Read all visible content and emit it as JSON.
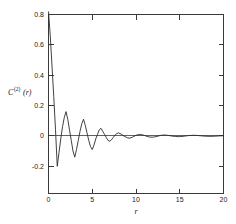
{
  "figure": {
    "background_color": "#ffffff",
    "line_color": "#2b2b2b",
    "axis_color": "#3a3a3a"
  },
  "axes": {
    "y_label_base": "C",
    "y_label_superscript": "(2)",
    "y_label_argument": "(r)",
    "x_label": "r",
    "y_ticks": [
      "0.8",
      "0.6",
      "0.4",
      "0.2",
      "0",
      "-0.2"
    ],
    "y_tick_values": [
      0.8,
      0.6,
      0.4,
      0.2,
      0,
      -0.2
    ],
    "x_ticks": [
      "0",
      "5",
      "10",
      "15",
      "20"
    ],
    "x_tick_values": [
      0,
      5,
      10,
      15,
      20
    ]
  },
  "chart_data": {
    "type": "line",
    "title": "",
    "xlabel": "r",
    "ylabel": "C^(2)(r)",
    "xlim": [
      0,
      20
    ],
    "ylim": [
      -0.28,
      0.8
    ],
    "grid": false,
    "legend": null,
    "series": [
      {
        "name": "C^(2)(r)",
        "color": "#2b2b2b",
        "x": [
          0.0,
          0.2,
          0.4,
          0.6,
          0.8,
          1.0,
          1.2,
          1.4,
          1.6,
          1.8,
          2.0,
          2.2,
          2.4,
          2.6,
          2.8,
          3.0,
          3.2,
          3.4,
          3.6,
          3.8,
          4.0,
          4.2,
          4.4,
          4.6,
          4.8,
          5.0,
          5.2,
          5.4,
          5.6,
          5.8,
          6.0,
          6.2,
          6.4,
          6.6,
          6.8,
          7.0,
          7.2,
          7.4,
          7.6,
          7.8,
          8.0,
          8.3,
          8.6,
          9.0,
          9.3,
          9.6,
          10.0,
          10.4,
          10.8,
          11.2,
          11.6,
          12.0,
          12.4,
          12.8,
          13.2,
          13.6,
          14.0,
          14.5,
          15.0,
          15.5,
          16.0,
          16.5,
          17.0,
          17.5,
          18.0,
          18.5,
          19.0,
          19.5,
          20.0
        ],
        "y": [
          0.82,
          0.66,
          0.46,
          0.26,
          0.04,
          -0.2,
          -0.11,
          -0.02,
          0.06,
          0.12,
          0.16,
          0.11,
          0.04,
          -0.03,
          -0.1,
          -0.14,
          -0.09,
          -0.03,
          0.03,
          0.08,
          0.11,
          0.07,
          0.02,
          -0.03,
          -0.07,
          -0.09,
          -0.06,
          -0.02,
          0.01,
          0.04,
          0.05,
          0.03,
          0.01,
          -0.01,
          -0.03,
          -0.035,
          -0.025,
          -0.01,
          0.005,
          0.015,
          0.02,
          0.012,
          0.0,
          -0.012,
          -0.015,
          -0.008,
          0.004,
          0.01,
          0.006,
          -0.002,
          -0.008,
          -0.008,
          -0.003,
          0.003,
          0.006,
          0.004,
          0.0,
          -0.004,
          -0.005,
          -0.002,
          0.002,
          0.004,
          0.003,
          0.0,
          -0.002,
          -0.003,
          -0.002,
          0.0,
          0.001
        ]
      }
    ],
    "annotations": [
      {
        "type": "zero-line",
        "y": 0,
        "from_x": 0,
        "to_x": 20
      }
    ]
  }
}
